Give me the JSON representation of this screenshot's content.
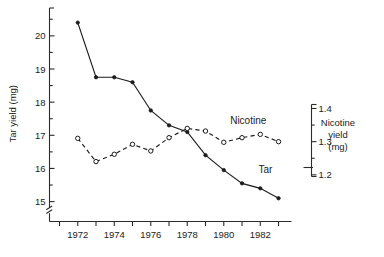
{
  "chart_data": {
    "type": "line",
    "title": "",
    "xlabel": "",
    "ylabel": "Tar yield (mg)",
    "y2label": "Nicotine yield (mg)",
    "x": [
      1972,
      1973,
      1974,
      1975,
      1976,
      1977,
      1978,
      1979,
      1980,
      1981,
      1982,
      1983
    ],
    "xlim": [
      1971,
      1983.6
    ],
    "xticks": [
      1971,
      1972,
      1973,
      1974,
      1975,
      1976,
      1977,
      1978,
      1979,
      1980,
      1981,
      1982,
      1983
    ],
    "xticklabels": [
      "",
      "1972",
      "",
      "1974",
      "",
      "1976",
      "",
      "1978",
      "",
      "1980",
      "",
      "1982",
      ""
    ],
    "ylim": [
      14.55,
      20.75
    ],
    "yticks": [
      15,
      16,
      17,
      18,
      19,
      20
    ],
    "yticklabels": [
      "15",
      "16",
      "17",
      "18",
      "19",
      "20"
    ],
    "y_minor_ticks": [
      15.5,
      16.5,
      17.5,
      18.5,
      19.5,
      20.5
    ],
    "y2lim": [
      1.195,
      1.412
    ],
    "y2ticks": [
      1.2,
      1.3,
      1.4
    ],
    "y2ticklabels": [
      "1.2",
      "1.3",
      "1.4"
    ],
    "y2_minor_ticks": [
      1.25,
      1.35
    ],
    "y_axis_break": true,
    "y2_axis_break": true,
    "grid": false,
    "legend_position": "inline-annotation",
    "series": [
      {
        "name": "Tar",
        "axis": "left",
        "marker": "filled-circle",
        "linestyle": "solid",
        "color": "#1c1c1c",
        "values": [
          20.4,
          18.75,
          18.75,
          18.6,
          17.75,
          17.3,
          17.1,
          16.4,
          15.95,
          15.55,
          15.4,
          15.1
        ]
      },
      {
        "name": "Nicotine",
        "axis": "right",
        "marker": "open-circle",
        "linestyle": "dashed",
        "color": "#1c1c1c",
        "values": [
          1.31,
          1.24,
          1.262,
          1.292,
          1.272,
          1.312,
          1.34,
          1.332,
          1.298,
          1.312,
          1.322,
          1.3
        ]
      }
    ],
    "annotations": [
      {
        "name": "nicotine-series-label",
        "text": "Nicotine",
        "x": 1980.35,
        "y": 1.352
      },
      {
        "name": "tar-series-label",
        "text": "Tar",
        "x": 1981.9,
        "y": 15.86
      }
    ]
  }
}
